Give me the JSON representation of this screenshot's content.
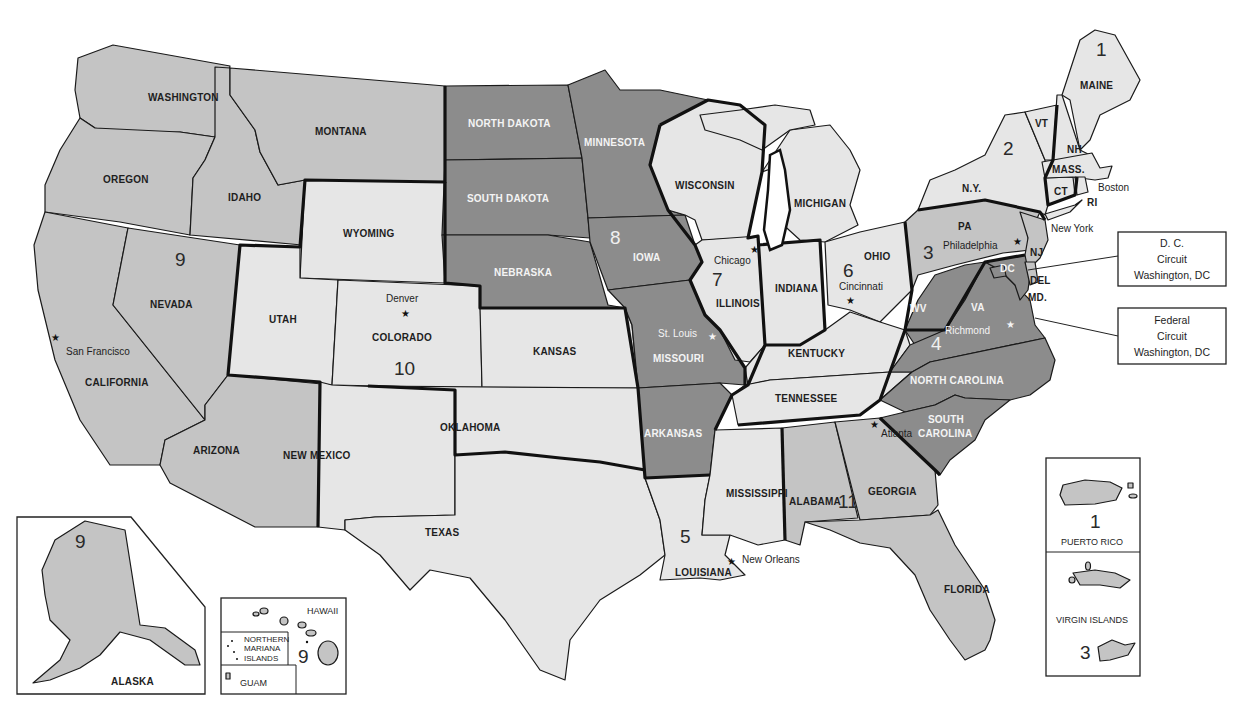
{
  "map": {
    "title": "U.S. Courts of Appeals — Judicial Circuits",
    "shading": {
      "light": "#e6e6e6",
      "mid": "#c4c4c4",
      "dark": "#8c8c8c",
      "boundary": "#111111",
      "background": "#ffffff"
    },
    "circuits": [
      {
        "number": "1",
        "states": [
          "MAINE",
          "NH",
          "MASS.",
          "RI"
        ],
        "territories": [
          "PUERTO RICO"
        ],
        "seat": "Boston"
      },
      {
        "number": "2",
        "states": [
          "N.Y.",
          "VT",
          "CT"
        ],
        "seat": "New York"
      },
      {
        "number": "3",
        "states": [
          "PA",
          "NJ",
          "DEL"
        ],
        "territories": [
          "VIRGIN ISLANDS"
        ],
        "seat": "Philadelphia"
      },
      {
        "number": "4",
        "states": [
          "MD.",
          "WV",
          "VA",
          "NORTH CAROLINA",
          "SOUTH CAROLINA"
        ],
        "seat": "Richmond"
      },
      {
        "number": "5",
        "states": [
          "TEXAS",
          "LOUISIANA",
          "MISSISSIPPI"
        ],
        "seat": "New Orleans"
      },
      {
        "number": "6",
        "states": [
          "MICHIGAN",
          "OHIO",
          "KENTUCKY",
          "TENNESSEE"
        ],
        "seat": "Cincinnati"
      },
      {
        "number": "7",
        "states": [
          "WISCONSIN",
          "ILLINOIS",
          "INDIANA"
        ],
        "seat": "Chicago"
      },
      {
        "number": "8",
        "states": [
          "NORTH DAKOTA",
          "SOUTH DAKOTA",
          "NEBRASKA",
          "MINNESOTA",
          "IOWA",
          "MISSOURI",
          "ARKANSAS"
        ],
        "seat": "St. Louis"
      },
      {
        "number": "9",
        "states": [
          "WASHINGTON",
          "OREGON",
          "CALIFORNIA",
          "NEVADA",
          "IDAHO",
          "MONTANA",
          "ARIZONA",
          "ALASKA",
          "HAWAII"
        ],
        "territories": [
          "NORTHERN MARIANA ISLANDS",
          "GUAM"
        ],
        "seat": "San Francisco"
      },
      {
        "number": "10",
        "states": [
          "WYOMING",
          "UTAH",
          "COLORADO",
          "KANSAS",
          "OKLAHOMA",
          "NEW MEXICO"
        ],
        "seat": "Denver"
      },
      {
        "number": "11",
        "states": [
          "ALABAMA",
          "GEORGIA",
          "FLORIDA"
        ],
        "seat": "Atlanta"
      }
    ],
    "state_labels": {
      "washington": "WASHINGTON",
      "oregon": "OREGON",
      "california": "CALIFORNIA",
      "nevada": "NEVADA",
      "idaho": "IDAHO",
      "montana": "MONTANA",
      "arizona": "ARIZONA",
      "wyoming": "WYOMING",
      "utah": "UTAH",
      "colorado": "COLORADO",
      "new_mexico": "NEW MEXICO",
      "kansas": "KANSAS",
      "oklahoma": "OKLAHOMA",
      "texas": "TEXAS",
      "north_dakota": "NORTH DAKOTA",
      "south_dakota": "SOUTH DAKOTA",
      "nebraska": "NEBRASKA",
      "minnesota": "MINNESOTA",
      "iowa": "IOWA",
      "missouri": "MISSOURI",
      "arkansas": "ARKANSAS",
      "louisiana": "LOUISIANA",
      "mississippi": "MISSISSIPPI",
      "wisconsin": "WISCONSIN",
      "illinois": "ILLINOIS",
      "indiana": "INDIANA",
      "michigan": "MICHIGAN",
      "ohio": "OHIO",
      "kentucky": "KENTUCKY",
      "tennessee": "TENNESSEE",
      "alabama": "ALABAMA",
      "georgia": "GEORGIA",
      "florida": "FLORIDA",
      "south_carolina_1": "SOUTH",
      "south_carolina_2": "CAROLINA",
      "north_carolina": "NORTH CAROLINA",
      "virginia": "VA",
      "west_virginia": "WV",
      "pennsylvania": "PA",
      "new_york": "N.Y.",
      "new_jersey": "NJ",
      "delaware": "DEL",
      "maryland": "MD.",
      "dc": "DC",
      "vermont": "VT",
      "new_hampshire": "NH",
      "maine": "MAINE",
      "massachusetts": "MASS.",
      "connecticut": "CT",
      "rhode_island": "RI"
    },
    "cities": {
      "san_francisco": "San Francisco",
      "denver": "Denver",
      "st_louis": "St. Louis",
      "chicago": "Chicago",
      "cincinnati": "Cincinnati",
      "philadelphia": "Philadelphia",
      "richmond": "Richmond",
      "atlanta": "Atlanta",
      "new_orleans": "New Orleans",
      "boston": "Boston",
      "new_york": "New York"
    },
    "circuit_number_labels": {
      "c1": "1",
      "c2": "2",
      "c3": "3",
      "c4": "4",
      "c5": "5",
      "c6": "6",
      "c7": "7",
      "c8": "8",
      "c9": "9",
      "c10": "10",
      "c11": "11"
    },
    "callouts": {
      "dc_circuit": {
        "line1": "D. C.",
        "line2": "Circuit",
        "line3": "Washington, DC"
      },
      "federal_circuit": {
        "line1": "Federal",
        "line2": "Circuit",
        "line3": "Washington, DC"
      }
    },
    "insets": {
      "alaska": {
        "label": "ALASKA",
        "circuit": "9"
      },
      "hawaii": {
        "label": "HAWAII",
        "circuit": "9"
      },
      "mariana": {
        "line1": "NORTHERN",
        "line2": "MARIANA",
        "line3": "ISLANDS"
      },
      "guam": {
        "label": "GUAM"
      },
      "puerto_rico": {
        "label": "PUERTO RICO",
        "circuit": "1"
      },
      "virgin_islands": {
        "label": "VIRGIN ISLANDS",
        "circuit": "3"
      }
    },
    "star_glyph": "★"
  }
}
